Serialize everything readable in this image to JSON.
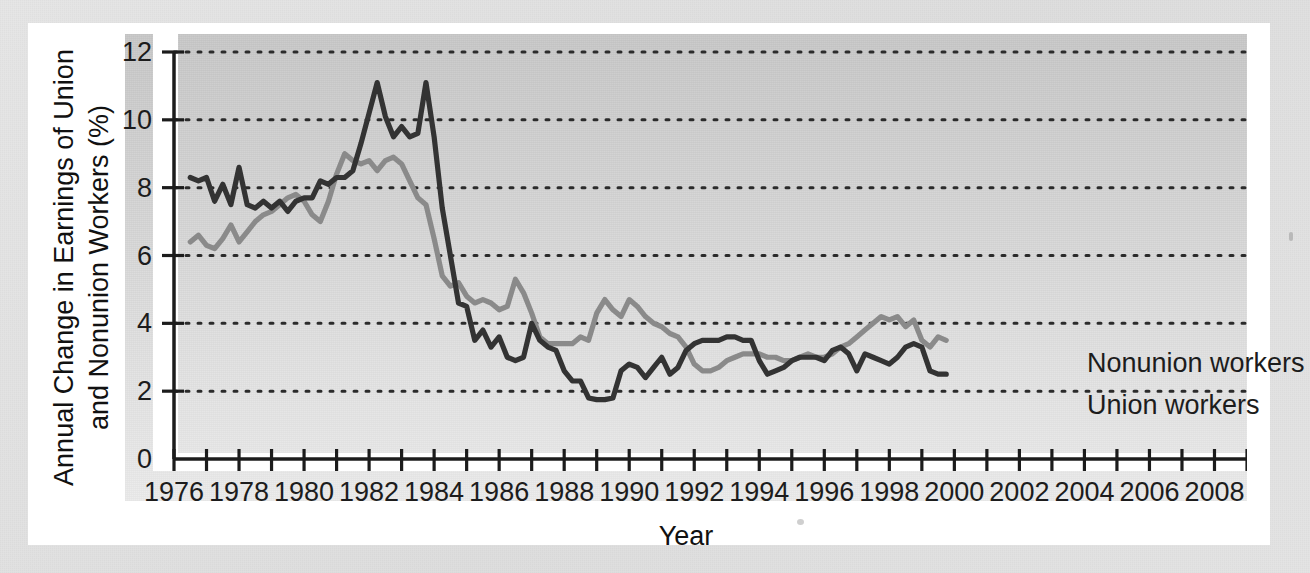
{
  "figure": {
    "ytitle": "Annual Change in Earnings of Union and Nonunion Workers (%)",
    "xtitle": "Year",
    "series_labels": {
      "nonunion": "Nonunion workers",
      "union": "Union workers"
    },
    "colors": {
      "union": "#333333",
      "nonunion": "#8a8a8a",
      "panel_top": "#c9c9c9",
      "panel_bottom": "#ececec",
      "card": "#ffffff",
      "page": "#e3e3e3",
      "text": "#1c1c1c"
    }
  },
  "chart_data": {
    "type": "line",
    "title": "",
    "xlabel": "Year",
    "ylabel": "Annual Change in Earnings of Union and Nonunion Workers (%)",
    "xlim": [
      1976,
      2009
    ],
    "ylim": [
      0,
      12
    ],
    "yticks": [
      0,
      2,
      4,
      6,
      8,
      10,
      12
    ],
    "ytick_labels": [
      "0",
      "2",
      "4",
      "6",
      "8",
      "10",
      "12"
    ],
    "xticks": [
      1976,
      1977,
      1978,
      1979,
      1980,
      1981,
      1982,
      1983,
      1984,
      1985,
      1986,
      1987,
      1988,
      1989,
      1990,
      1991,
      1992,
      1993,
      1994,
      1995,
      1996,
      1997,
      1998,
      1999,
      2000,
      2001,
      2002,
      2003,
      2004,
      2005,
      2006,
      2007,
      2008,
      2009
    ],
    "xtick_labels_shown": [
      "1976",
      "1978",
      "1980",
      "1982",
      "1984",
      "1986",
      "1988",
      "1990",
      "1992",
      "1994",
      "1996",
      "1998",
      "2000",
      "2002",
      "2004",
      "2006",
      "2008"
    ],
    "grid": "horizontal-dotted",
    "legend_position": "inline-right-of-line-ends",
    "x": [
      1976.5,
      1976.75,
      1977.0,
      1977.25,
      1977.5,
      1977.75,
      1978.0,
      1978.25,
      1978.5,
      1978.75,
      1979.0,
      1979.25,
      1979.5,
      1979.75,
      1980.0,
      1980.25,
      1980.5,
      1980.75,
      1981.0,
      1981.25,
      1981.5,
      1981.75,
      1982.0,
      1982.25,
      1982.5,
      1982.75,
      1983.0,
      1983.25,
      1983.5,
      1983.75,
      1984.0,
      1984.25,
      1984.5,
      1984.75,
      1985.0,
      1985.25,
      1985.5,
      1985.75,
      1986.0,
      1986.25,
      1986.5,
      1986.75,
      1987.0,
      1987.25,
      1987.5,
      1987.75,
      1988.0,
      1988.25,
      1988.5,
      1988.75,
      1989.0,
      1989.25,
      1989.5,
      1989.75,
      1990.0,
      1990.25,
      1990.5,
      1990.75,
      1991.0,
      1991.25,
      1991.5,
      1991.75,
      1992.0,
      1992.25,
      1992.5,
      1992.75,
      1993.0,
      1993.25,
      1993.5,
      1993.75,
      1994.0,
      1994.25,
      1994.5,
      1994.75,
      1995.0,
      1995.25,
      1995.5,
      1995.75,
      1996.0,
      1996.25,
      1996.5,
      1996.75,
      1997.0,
      1997.25,
      1997.5,
      1997.75,
      1998.0,
      1998.25,
      1998.5,
      1998.75,
      1999.0,
      1999.25,
      1999.5,
      1999.75
    ],
    "series": [
      {
        "name": "Union workers",
        "color": "#333333",
        "values": [
          8.3,
          8.2,
          8.3,
          7.6,
          8.1,
          7.5,
          8.6,
          7.5,
          7.4,
          7.6,
          7.4,
          7.6,
          7.3,
          7.6,
          7.7,
          7.7,
          8.2,
          8.1,
          8.3,
          8.3,
          8.5,
          9.3,
          10.2,
          11.1,
          10.1,
          9.5,
          9.8,
          9.5,
          9.6,
          11.1,
          9.5,
          7.4,
          6.0,
          4.6,
          4.5,
          3.5,
          3.8,
          3.3,
          3.6,
          3.0,
          2.9,
          3.0,
          4.0,
          3.5,
          3.3,
          3.2,
          2.6,
          2.3,
          2.3,
          1.8,
          1.75,
          1.75,
          1.8,
          2.6,
          2.8,
          2.7,
          2.4,
          2.7,
          3.0,
          2.5,
          2.7,
          3.2,
          3.4,
          3.5,
          3.5,
          3.5,
          3.6,
          3.6,
          3.5,
          3.5,
          2.9,
          2.5,
          2.6,
          2.7,
          2.9,
          3.0,
          3.0,
          3.0,
          2.9,
          3.2,
          3.3,
          3.1,
          2.6,
          3.1,
          3.0,
          2.9,
          2.8,
          3.0,
          3.3,
          3.4,
          3.3,
          2.6,
          2.5,
          2.5
        ]
      },
      {
        "name": "Nonunion workers",
        "color": "#8a8a8a",
        "values": [
          6.4,
          6.6,
          6.3,
          6.2,
          6.5,
          6.9,
          6.4,
          6.7,
          7.0,
          7.2,
          7.3,
          7.5,
          7.7,
          7.8,
          7.6,
          7.2,
          7.0,
          7.6,
          8.4,
          9.0,
          8.8,
          8.7,
          8.8,
          8.5,
          8.8,
          8.9,
          8.7,
          8.2,
          7.7,
          7.5,
          6.5,
          5.4,
          5.1,
          5.2,
          4.8,
          4.6,
          4.7,
          4.6,
          4.4,
          4.5,
          5.3,
          4.9,
          4.3,
          3.6,
          3.4,
          3.4,
          3.4,
          3.4,
          3.6,
          3.5,
          4.3,
          4.7,
          4.4,
          4.2,
          4.7,
          4.5,
          4.2,
          4.0,
          3.9,
          3.7,
          3.6,
          3.3,
          2.8,
          2.6,
          2.6,
          2.7,
          2.9,
          3.0,
          3.1,
          3.1,
          3.1,
          3.0,
          3.0,
          2.9,
          2.9,
          3.0,
          3.1,
          3.0,
          3.0,
          3.1,
          3.3,
          3.4,
          3.6,
          3.8,
          4.0,
          4.2,
          4.1,
          4.2,
          3.9,
          4.1,
          3.5,
          3.3,
          3.6,
          3.5
        ]
      }
    ]
  }
}
